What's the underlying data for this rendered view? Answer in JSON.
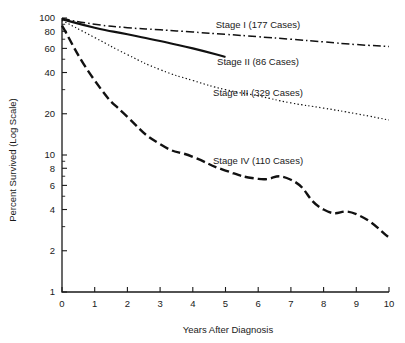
{
  "chart_data": {
    "type": "line",
    "title": "",
    "xlabel": "Years After Diagnosis",
    "ylabel": "Percent Survived (Log Scale)",
    "yscale": "log",
    "xlim": [
      0,
      10
    ],
    "ylim": [
      1,
      100
    ],
    "grid": false,
    "legend_position": "inline-right",
    "xticks": [
      "0",
      "1",
      "2",
      "3",
      "4",
      "5",
      "6",
      "7",
      "8",
      "9",
      "10"
    ],
    "xtick_values": [
      0,
      1,
      2,
      3,
      4,
      5,
      6,
      7,
      8,
      9,
      10
    ],
    "yticks": [
      "100",
      "80",
      "60",
      "40",
      "20",
      "10",
      "8",
      "6",
      "4",
      "2",
      "1"
    ],
    "ytick_values": [
      100,
      80,
      60,
      40,
      20,
      10,
      8,
      6,
      4,
      2,
      1
    ],
    "yticks_minor": [
      90,
      70,
      50,
      30,
      9,
      7,
      5,
      3
    ],
    "x": [
      0,
      1,
      2,
      3,
      4,
      5,
      6,
      7,
      8,
      9,
      10
    ],
    "series": [
      {
        "name": "Stage I",
        "label": "Stage I (177 Cases)",
        "cases": 177,
        "linestyle": "dash-dot",
        "color": "#111111",
        "values": [
          99,
          90,
          85,
          82,
          79,
          76,
          73,
          70,
          67,
          64,
          62
        ]
      },
      {
        "name": "Stage II",
        "label": "Stage II (86 Cases)",
        "cases": 86,
        "linestyle": "solid",
        "color": "#111111",
        "values": [
          98,
          85,
          76,
          68,
          60,
          52,
          null,
          null,
          null,
          null,
          null
        ]
      },
      {
        "name": "Stage III",
        "label": "Stage III (329 Cases)",
        "cases": 329,
        "linestyle": "dotted",
        "color": "#111111",
        "values": [
          96,
          72,
          54,
          42,
          35,
          30,
          27,
          24,
          22,
          20,
          18
        ]
      },
      {
        "name": "Stage IV",
        "label": "Stage IV (110 Cases)",
        "cases": 110,
        "linestyle": "dashed",
        "color": "#111111",
        "values": [
          88,
          35,
          19,
          12,
          9.7,
          7.7,
          6.7,
          6.6,
          4.0,
          3.7,
          2.5
        ]
      }
    ],
    "series_label_positions": [
      {
        "name": "Stage I",
        "x_px": 258,
        "y_px": 28
      },
      {
        "name": "Stage II",
        "x_px": 258,
        "y_px": 65
      },
      {
        "name": "Stage III",
        "x_px": 258,
        "y_px": 96
      },
      {
        "name": "Stage IV",
        "x_px": 258,
        "y_px": 164
      }
    ]
  }
}
